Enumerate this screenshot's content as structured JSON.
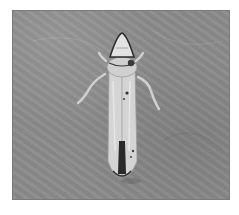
{
  "image": {
    "subject": "leafhopper insect",
    "description": "Grayscale photograph of a leafhopper viewed from above on a textured gray surface",
    "colors": {
      "background": "#8b8b8b",
      "insect_body": "#d6d6d6",
      "markings": "#2a2a2a",
      "frame": "#ffffff"
    }
  }
}
